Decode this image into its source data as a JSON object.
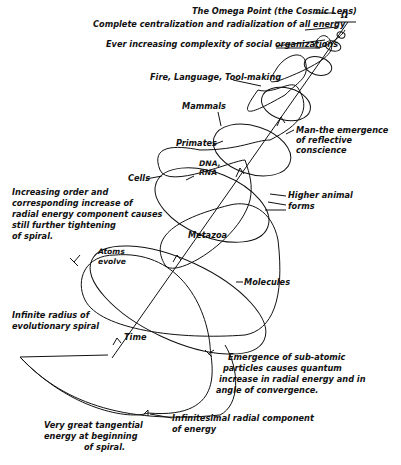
{
  "diagram": {
    "symbol": "Ω",
    "labels": {
      "omega_point": "The Omega Point (the Cosmic Lens)",
      "centralization": "Complete centralization and radialization of all energy",
      "social": "Ever increasing complexity of social organizations",
      "fire": "Fire, Language, Tool-making",
      "mammals": "Mammals",
      "man_1": "Man-the emergence",
      "man_2": "of reflective",
      "man_3": "conscience",
      "primates": "Primates",
      "dna_1": "DNA,",
      "dna_2": "RNA",
      "cells": "Cells",
      "order_1": "Increasing order and",
      "order_2": "corresponding increase of",
      "order_3": "radial energy component causes",
      "order_4": "still further tightening",
      "order_5": "of spiral.",
      "higher_1": "Higher animal",
      "higher_2": "forms",
      "metazoa": "Metazoa",
      "atoms_1": "Atoms",
      "atoms_2": "evolve",
      "molecules": "Molecules",
      "infinite_1": "Infinite radius of",
      "infinite_2": "evolutionary spiral",
      "time": "Time",
      "subatomic_1": "Emergence of sub-atomic",
      "subatomic_2": "particles causes quantum",
      "subatomic_3": "increase in radial energy and in",
      "subatomic_4": "angle of convergence.",
      "tangential_1": "Very great tangential",
      "tangential_2": "energy at beginning",
      "tangential_3": "of spiral.",
      "infinitesimal_1": "Infinitesimal radial component",
      "infinitesimal_2": "of energy"
    }
  }
}
